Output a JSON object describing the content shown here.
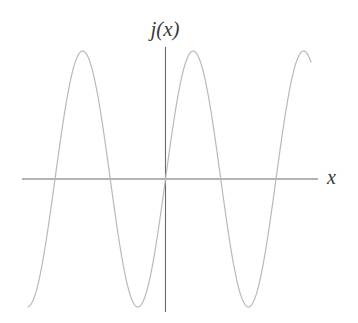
{
  "figure": {
    "kind": "function-graph",
    "background_color": "#ffffff",
    "width": 358,
    "height": 323
  },
  "labels": {
    "y_axis": "j(x)",
    "x_axis": "x"
  },
  "axes": {
    "color": "#6a6a6a",
    "stroke_width": 1.1,
    "x_axis": {
      "x1": 22,
      "y1": 179,
      "x2": 318,
      "y2": 179
    },
    "y_axis": {
      "x1": 165.5,
      "y1": 47,
      "x2": 165.5,
      "y2": 312
    },
    "origin": {
      "x": 165.5,
      "y": 179
    },
    "ticks": [],
    "grid": false
  },
  "curve": {
    "color": "#b9b9b9",
    "stroke_width": 1.2,
    "fill": "none"
  },
  "chart_data": {
    "type": "line",
    "title": "",
    "xlabel": "x",
    "ylabel": "j(x)",
    "legend": [],
    "grid": false,
    "axis_tick_labels": {
      "x": [],
      "y": []
    },
    "waveform": {
      "shape": "cosine",
      "amplitude_px": 128,
      "period_px": 110.5,
      "phase": "peak-left-of-origin",
      "zero_line_y_px": 179,
      "x_domain_px": [
        28,
        311
      ]
    },
    "zero_crossings_px": [
      55,
      110.5,
      165.5,
      221.5,
      277
    ],
    "peaks_px": [
      {
        "x": 82,
        "y": 51
      },
      {
        "x": 193,
        "y": 51
      },
      {
        "x": 304,
        "y": 51
      }
    ],
    "troughs_px": [
      {
        "x": 137,
        "y": 307
      },
      {
        "x": 248,
        "y": 307
      }
    ],
    "x": [
      28,
      33,
      38,
      43,
      48,
      55,
      62,
      68,
      75,
      82,
      89,
      96,
      103,
      110.5,
      117,
      124,
      131,
      137,
      144,
      151,
      158,
      165.5,
      172,
      179,
      186,
      193,
      200,
      207,
      214,
      221.5,
      228,
      235,
      242,
      248,
      255,
      262,
      269,
      277,
      284,
      291,
      298,
      304,
      311
    ],
    "y": [
      -121,
      -110,
      -95,
      -76,
      -53,
      0,
      52,
      86,
      114,
      128,
      124,
      103,
      68,
      0,
      -53,
      -96,
      -122,
      -128,
      -118,
      -90,
      -49,
      0,
      49,
      90,
      118,
      128,
      118,
      90,
      49,
      0,
      -49,
      -90,
      -118,
      -128,
      -118,
      -90,
      -49,
      0,
      49,
      90,
      118,
      128,
      122
    ]
  }
}
